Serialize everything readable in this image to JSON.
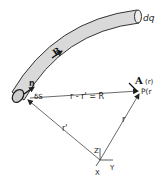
{
  "diagram": {
    "labels": {
      "charge_element": "dq",
      "magnetic_field": "B",
      "normal": "n",
      "surface_element": "δS",
      "relative_vector": "r - r' = R",
      "source_position": "r'",
      "field_position": "r",
      "field_point": "P(r",
      "vector_potential": "A",
      "vector_potential_arg": "(r)",
      "axis_z": "Z",
      "axis_y": "Y",
      "axis_x": "X"
    },
    "colors": {
      "tube_fill": "#d9d9d9",
      "line": "#333333",
      "background": "#ffffff"
    }
  }
}
